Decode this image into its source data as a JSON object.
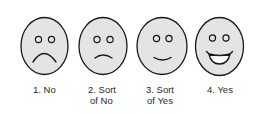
{
  "figure": {
    "title": "",
    "options": [
      {
        "number": "1.",
        "line1": "1. No",
        "line2": "",
        "expression": "frown"
      },
      {
        "number": "2.",
        "line1": "2. Sort",
        "line2": "of No",
        "expression": "slight-frown"
      },
      {
        "number": "3.",
        "line1": "3. Sort",
        "line2": "of Yes",
        "expression": "slight-smile"
      },
      {
        "number": "4.",
        "line1": "4. Yes",
        "line2": "",
        "expression": "big-smile"
      }
    ],
    "colors": {
      "face_fill": "#e4e4e4",
      "stroke": "#1a1a1a",
      "text": "#2a2a2a",
      "background": "#ffffff"
    }
  }
}
